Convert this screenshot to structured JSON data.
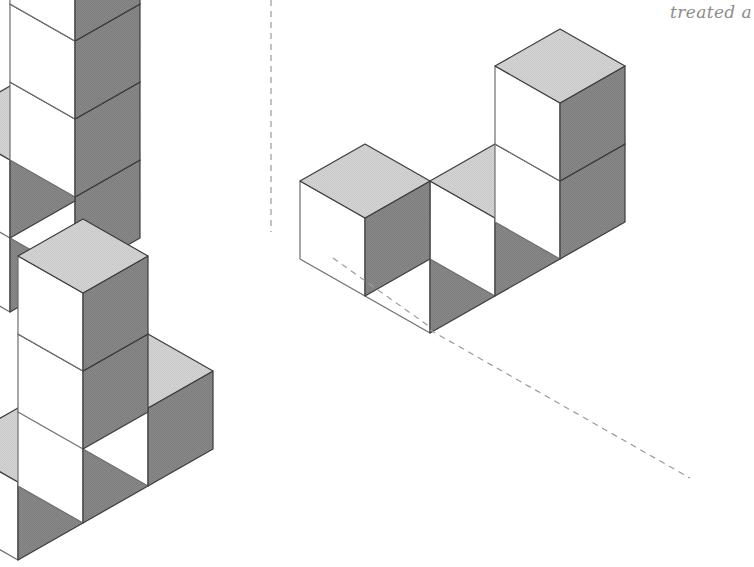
{
  "page": {
    "width": 754,
    "height": 567,
    "background": "#ffffff",
    "kind": "isometric-cube-assembly-diagram"
  },
  "annotation": {
    "handwritten_note": "treated a",
    "note_color": "#8c8c8c",
    "note_clipped_at_right_edge": true
  },
  "palette": {
    "top_face": "#d2d2d2",
    "left_face": "#ffffff",
    "right_face": "#8a8a8a",
    "outline": "#3c3c3c",
    "outline_light": "#6e6e6e",
    "dashed_line": "#9a9a9a",
    "background": "#ffffff"
  },
  "geometry": {
    "half_width": 65,
    "half_height": 37,
    "cube_height": 78,
    "projection": "isometric-2to1",
    "stroke_width": 1.2
  },
  "figures": [
    {
      "id": "figure-left",
      "label": "Left cube assembly",
      "origin": {
        "x": 10,
        "y": 312
      },
      "description": "L-shaped stack with a tall vertical column running off the top edge of the frame",
      "cubes": [
        {
          "x": 0,
          "y": 0,
          "z": 0
        },
        {
          "x": 1,
          "y": 0,
          "z": 0
        },
        {
          "x": 1,
          "y": 1,
          "z": 0
        },
        {
          "x": 1,
          "y": 0,
          "z": 1
        },
        {
          "x": 1,
          "y": 0,
          "z": 2
        },
        {
          "x": 1,
          "y": 0,
          "z": 3
        }
      ],
      "clipped_at_top": true
    },
    {
      "id": "figure-middle",
      "label": "Middle cube assembly",
      "origin": {
        "x": 18,
        "y": 560
      },
      "description": "Row of three cubes along one axis with a two-high stack and a perpendicular arm",
      "cubes": [
        {
          "x": 0,
          "y": 0,
          "z": 0
        },
        {
          "x": 1,
          "y": 0,
          "z": 0
        },
        {
          "x": 2,
          "y": 0,
          "z": 0
        },
        {
          "x": 2,
          "y": 1,
          "z": 0
        },
        {
          "x": 2,
          "y": 1,
          "z": 1
        }
      ],
      "clipped_at_bottom": true
    },
    {
      "id": "figure-right",
      "label": "Right cube assembly",
      "origin": {
        "x": 430,
        "y": 333
      },
      "description": "Long horizontal wall of cubes two high at the right end, with a recessed step",
      "cubes": [
        {
          "x": 0,
          "y": 0,
          "z": 0
        },
        {
          "x": 1,
          "y": 0,
          "z": 0
        },
        {
          "x": 2,
          "y": 0,
          "z": 0
        },
        {
          "x": 2,
          "y": 0,
          "z": 1
        },
        {
          "x": 0,
          "y": 1,
          "z": 0
        }
      ],
      "clipped_at_right": true
    }
  ],
  "guides": [
    {
      "id": "guide-vertical-dashed",
      "label": "Vertical dashed alignment line above left figure",
      "x1": 271,
      "y1": 0,
      "x2": 271,
      "y2": 232,
      "style": "dashed"
    },
    {
      "id": "guide-diagonal-dashed-upper",
      "label": "Dashed projection line from middle figure to right figure",
      "x1": 333,
      "y1": 258,
      "x2": 430,
      "y2": 327,
      "style": "dashed"
    },
    {
      "id": "guide-diagonal-dashed-lower",
      "label": "Hidden bottom edge of right figure shown dashed",
      "x1": 430,
      "y1": 330,
      "x2": 690,
      "y2": 478,
      "style": "dashed"
    }
  ]
}
